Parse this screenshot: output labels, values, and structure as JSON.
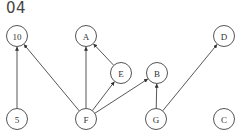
{
  "title": "04",
  "nodes": [
    {
      "id": "10",
      "label": "10",
      "x": 17,
      "y": 36
    },
    {
      "id": "A",
      "label": "A",
      "x": 86,
      "y": 36
    },
    {
      "id": "D",
      "label": "D",
      "x": 224,
      "y": 36
    },
    {
      "id": "E",
      "label": "E",
      "x": 121,
      "y": 73
    },
    {
      "id": "B",
      "label": "B",
      "x": 157,
      "y": 73
    },
    {
      "id": "5",
      "label": "5",
      "x": 17,
      "y": 119
    },
    {
      "id": "F",
      "label": "F",
      "x": 86,
      "y": 119
    },
    {
      "id": "G",
      "label": "G",
      "x": 156,
      "y": 119
    },
    {
      "id": "C",
      "label": "C",
      "x": 224,
      "y": 119
    }
  ],
  "edges": [
    {
      "from": "5",
      "to": "10"
    },
    {
      "from": "F",
      "to": "10"
    },
    {
      "from": "F",
      "to": "A"
    },
    {
      "from": "F",
      "to": "E"
    },
    {
      "from": "F",
      "to": "B"
    },
    {
      "from": "E",
      "to": "A"
    },
    {
      "from": "G",
      "to": "B"
    },
    {
      "from": "G",
      "to": "D"
    }
  ],
  "node_radius": 10.5
}
